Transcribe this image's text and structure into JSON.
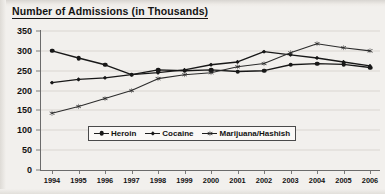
{
  "chart_data": {
    "type": "line",
    "title": "Number of Admissions (in Thousands)",
    "xlabel": "",
    "ylabel": "",
    "ylim": [
      0,
      350
    ],
    "ytick_step": 50,
    "yticks": [
      0,
      50,
      100,
      150,
      200,
      250,
      300,
      350
    ],
    "grid": true,
    "legend_position": "inside-bottom-center",
    "categories": [
      "1994",
      "1995",
      "1996",
      "1997",
      "1998",
      "1999",
      "2000",
      "2001",
      "2002",
      "2003",
      "2004",
      "2005",
      "2006"
    ],
    "series": [
      {
        "name": "Heroin",
        "marker": "circle",
        "color": "#181818",
        "values": [
          300,
          282,
          265,
          240,
          252,
          250,
          252,
          248,
          250,
          265,
          268,
          266,
          258
        ]
      },
      {
        "name": "Cocaine",
        "marker": "diamond",
        "color": "#181818",
        "values": [
          220,
          228,
          232,
          240,
          245,
          252,
          265,
          272,
          298,
          290,
          282,
          272,
          262
        ]
      },
      {
        "name": "Marijuana/Hashish",
        "marker": "star",
        "color": "#2c2c2c",
        "values": [
          143,
          160,
          180,
          200,
          230,
          240,
          245,
          260,
          268,
          295,
          318,
          308,
          300
        ]
      }
    ]
  },
  "axes": {
    "ytick_labels": [
      "350",
      "300",
      "250",
      "200",
      "150",
      "100",
      "50",
      "0"
    ],
    "xtick_labels": [
      "1994",
      "1995",
      "1996",
      "1997",
      "1998",
      "1999",
      "2000",
      "2001",
      "2002",
      "2003",
      "2004",
      "2005",
      "2006"
    ]
  },
  "legend": {
    "items": [
      {
        "label": "Heroin",
        "marker": "circle"
      },
      {
        "label": "Cocaine",
        "marker": "diamond"
      },
      {
        "label": "Marijuana/Hashish",
        "marker": "star"
      }
    ]
  }
}
